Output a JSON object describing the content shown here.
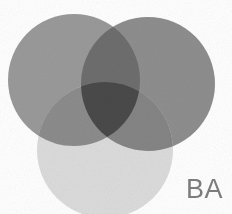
{
  "logo": {
    "name": "three-circle-venn-logo",
    "background_color": "#ffffff",
    "circles": [
      {
        "id": "left",
        "label": "left-circle",
        "color": "#9a9a9a",
        "cx": 74,
        "cy": 80,
        "r": 66
      },
      {
        "id": "right",
        "label": "right-circle",
        "color": "#8e8e8e",
        "cx": 148,
        "cy": 84,
        "r": 67
      },
      {
        "id": "bottom",
        "label": "bottom-circle",
        "color": "#dcdcdc",
        "cx": 105,
        "cy": 150,
        "r": 68
      }
    ],
    "overlap_colors": {
      "left_right": "#6e6e6e",
      "left_bottom": "#8c8c8c",
      "right_bottom": "#858585",
      "triple": "#4a4a4a"
    }
  },
  "wordmark": {
    "text": "BA",
    "color": "#7c7c7c",
    "clipped": true
  }
}
